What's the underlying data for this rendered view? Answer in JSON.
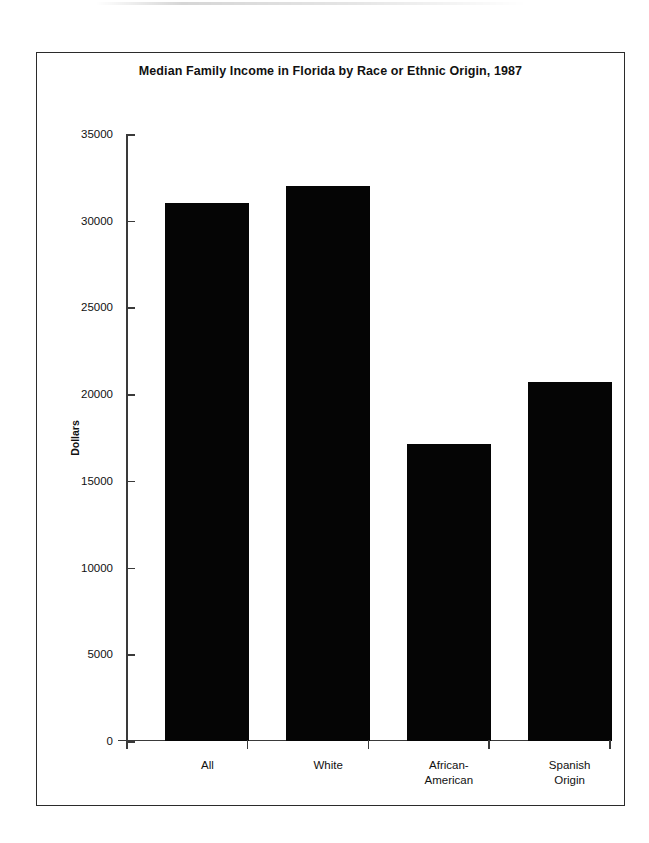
{
  "figure": {
    "background_color": "#ffffff",
    "border_color": "#2b2b2b",
    "bar_color": "#050505"
  },
  "chart_data": {
    "type": "bar",
    "title": "Median Family Income in Florida by Race or Ethnic Origin, 1987",
    "xlabel": "",
    "ylabel": "Dollars",
    "categories": [
      "All",
      "White",
      "African-American",
      "Spanish Origin"
    ],
    "category_lines": [
      [
        "All"
      ],
      [
        "White"
      ],
      [
        "African-",
        "American"
      ],
      [
        "Spanish",
        "Origin"
      ]
    ],
    "values": [
      31000,
      32000,
      17100,
      20700
    ],
    "ylim": [
      0,
      35000
    ],
    "ytick_values": [
      0,
      5000,
      10000,
      15000,
      20000,
      25000,
      30000,
      35000
    ],
    "ytick_labels": [
      "0",
      "5000",
      "10000",
      "15000",
      "20000",
      "25000",
      "30000",
      "35000"
    ],
    "grid": false,
    "legend": false
  }
}
